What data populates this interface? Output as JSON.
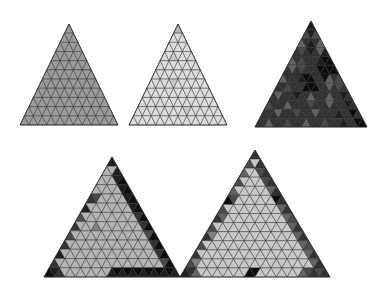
{
  "figure": {
    "background_color": "#ffffff",
    "width": 387,
    "height": 289,
    "edge_color": "#2b2b2b",
    "edge_width": 0.45,
    "palette": {
      "black": "#0d0d0d",
      "very_dark": "#1f1f1f",
      "dark": "#333333",
      "dark_mid": "#4a4a4a",
      "mid_dark": "#636363",
      "mid": "#808080",
      "mid_light": "#9a9a9a",
      "light": "#b4b4b4",
      "lighter": "#c8c8c8",
      "very_light": "#dcdcdc",
      "near_white": "#ededed"
    },
    "panels": [
      {
        "name": "panel-top-left",
        "index": 0,
        "apex_x": 69,
        "apex_y": 24,
        "half_base": 49,
        "base_y": 125,
        "rows": 11,
        "base_fill": "#9a9a9a",
        "description": "uniform medium gray triangular mesh",
        "overrides": []
      },
      {
        "name": "panel-top-middle",
        "index": 1,
        "apex_x": 178,
        "apex_y": 24,
        "half_base": 49,
        "base_y": 125,
        "rows": 11,
        "base_fill": "#dcdcdc",
        "description": "uniform light gray triangular mesh",
        "overrides": [
          {
            "row": 0,
            "cell": 0,
            "fill": "#b4b4b4"
          },
          {
            "row": 3,
            "cell": 2,
            "fill": "#c8c8c8"
          },
          {
            "row": 6,
            "cell": 5,
            "fill": "#c8c8c8"
          },
          {
            "row": 9,
            "cell": 11,
            "fill": "#c8c8c8"
          }
        ]
      },
      {
        "name": "panel-top-right",
        "index": 2,
        "apex_x": 311,
        "apex_y": 21,
        "half_base": 56,
        "base_y": 127,
        "rows": 12,
        "base_fill": "#333333",
        "description": "dark mesh with mottled light and black cells",
        "overrides": [
          {
            "row": 0,
            "cell": 0,
            "fill": "#1f1f1f"
          },
          {
            "row": 1,
            "cell": 0,
            "fill": "#4a4a4a"
          },
          {
            "row": 1,
            "cell": 1,
            "fill": "#1f1f1f"
          },
          {
            "row": 1,
            "cell": 2,
            "fill": "#4a4a4a"
          },
          {
            "row": 2,
            "cell": 0,
            "fill": "#636363"
          },
          {
            "row": 2,
            "cell": 2,
            "fill": "#1f1f1f"
          },
          {
            "row": 2,
            "cell": 4,
            "fill": "#636363"
          },
          {
            "row": 3,
            "cell": 1,
            "fill": "#4a4a4a"
          },
          {
            "row": 3,
            "cell": 3,
            "fill": "#1f1f1f"
          },
          {
            "row": 3,
            "cell": 5,
            "fill": "#636363"
          },
          {
            "row": 3,
            "cell": 6,
            "fill": "#1f1f1f"
          },
          {
            "row": 4,
            "cell": 0,
            "fill": "#636363"
          },
          {
            "row": 4,
            "cell": 2,
            "fill": "#4a4a4a"
          },
          {
            "row": 4,
            "cell": 6,
            "fill": "#1f1f1f"
          },
          {
            "row": 4,
            "cell": 7,
            "fill": "#0d0d0d"
          },
          {
            "row": 4,
            "cell": 8,
            "fill": "#0d0d0d"
          },
          {
            "row": 5,
            "cell": 1,
            "fill": "#636363"
          },
          {
            "row": 5,
            "cell": 3,
            "fill": "#4a4a4a"
          },
          {
            "row": 5,
            "cell": 7,
            "fill": "#0d0d0d"
          },
          {
            "row": 5,
            "cell": 8,
            "fill": "#0d0d0d"
          },
          {
            "row": 5,
            "cell": 9,
            "fill": "#0d0d0d"
          },
          {
            "row": 5,
            "cell": 10,
            "fill": "#0d0d0d"
          },
          {
            "row": 6,
            "cell": 0,
            "fill": "#636363"
          },
          {
            "row": 6,
            "cell": 4,
            "fill": "#1f1f1f"
          },
          {
            "row": 6,
            "cell": 5,
            "fill": "#0d0d0d"
          },
          {
            "row": 6,
            "cell": 6,
            "fill": "#0d0d0d"
          },
          {
            "row": 6,
            "cell": 9,
            "fill": "#0d0d0d"
          },
          {
            "row": 6,
            "cell": 10,
            "fill": "#636363"
          },
          {
            "row": 6,
            "cell": 12,
            "fill": "#4a4a4a"
          },
          {
            "row": 7,
            "cell": 2,
            "fill": "#4a4a4a"
          },
          {
            "row": 7,
            "cell": 6,
            "fill": "#0d0d0d"
          },
          {
            "row": 7,
            "cell": 7,
            "fill": "#0d0d0d"
          },
          {
            "row": 7,
            "cell": 8,
            "fill": "#0d0d0d"
          },
          {
            "row": 7,
            "cell": 11,
            "fill": "#636363"
          },
          {
            "row": 7,
            "cell": 13,
            "fill": "#4a4a4a"
          },
          {
            "row": 8,
            "cell": 1,
            "fill": "#636363"
          },
          {
            "row": 8,
            "cell": 5,
            "fill": "#1f1f1f"
          },
          {
            "row": 8,
            "cell": 8,
            "fill": "#636363"
          },
          {
            "row": 8,
            "cell": 12,
            "fill": "#636363"
          },
          {
            "row": 8,
            "cell": 15,
            "fill": "#1f1f1f"
          },
          {
            "row": 9,
            "cell": 0,
            "fill": "#4a4a4a"
          },
          {
            "row": 9,
            "cell": 4,
            "fill": "#636363"
          },
          {
            "row": 9,
            "cell": 9,
            "fill": "#4a4a4a"
          },
          {
            "row": 9,
            "cell": 13,
            "fill": "#636363"
          },
          {
            "row": 9,
            "cell": 17,
            "fill": "#1f1f1f"
          },
          {
            "row": 10,
            "cell": 3,
            "fill": "#636363"
          },
          {
            "row": 10,
            "cell": 7,
            "fill": "#4a4a4a"
          },
          {
            "row": 10,
            "cell": 11,
            "fill": "#636363"
          },
          {
            "row": 10,
            "cell": 16,
            "fill": "#1f1f1f"
          },
          {
            "row": 10,
            "cell": 19,
            "fill": "#0d0d0d"
          },
          {
            "row": 11,
            "cell": 2,
            "fill": "#636363"
          },
          {
            "row": 11,
            "cell": 6,
            "fill": "#4a4a4a"
          },
          {
            "row": 11,
            "cell": 10,
            "fill": "#636363"
          },
          {
            "row": 11,
            "cell": 14,
            "fill": "#4a4a4a"
          },
          {
            "row": 11,
            "cell": 18,
            "fill": "#1f1f1f"
          },
          {
            "row": 11,
            "cell": 21,
            "fill": "#0d0d0d"
          },
          {
            "row": 11,
            "cell": 22,
            "fill": "#0d0d0d"
          }
        ]
      },
      {
        "name": "panel-bottom-left",
        "index": 3,
        "apex_x": 112,
        "apex_y": 157,
        "half_base": 68,
        "base_y": 277,
        "rows": 13,
        "base_fill": "#b4b4b4",
        "description": "light gray mesh with dark right flank, dark left notch and dark base row",
        "overrides": [
          {
            "row": 0,
            "cell": 0,
            "fill": "#1f1f1f"
          },
          {
            "row": 1,
            "cell": 2,
            "fill": "#1f1f1f"
          },
          {
            "row": 2,
            "cell": 3,
            "fill": "#1f1f1f"
          },
          {
            "row": 2,
            "cell": 4,
            "fill": "#0d0d0d"
          },
          {
            "row": 3,
            "cell": 5,
            "fill": "#1f1f1f"
          },
          {
            "row": 3,
            "cell": 6,
            "fill": "#0d0d0d"
          },
          {
            "row": 4,
            "cell": 0,
            "fill": "#333333"
          },
          {
            "row": 4,
            "cell": 1,
            "fill": "#4a4a4a"
          },
          {
            "row": 4,
            "cell": 7,
            "fill": "#1f1f1f"
          },
          {
            "row": 4,
            "cell": 8,
            "fill": "#0d0d0d"
          },
          {
            "row": 5,
            "cell": 0,
            "fill": "#1f1f1f"
          },
          {
            "row": 5,
            "cell": 9,
            "fill": "#1f1f1f"
          },
          {
            "row": 5,
            "cell": 10,
            "fill": "#0d0d0d"
          },
          {
            "row": 6,
            "cell": 0,
            "fill": "#4a4a4a"
          },
          {
            "row": 6,
            "cell": 11,
            "fill": "#333333"
          },
          {
            "row": 6,
            "cell": 12,
            "fill": "#0d0d0d"
          },
          {
            "row": 7,
            "cell": 0,
            "fill": "#333333"
          },
          {
            "row": 7,
            "cell": 4,
            "fill": "#808080"
          },
          {
            "row": 7,
            "cell": 13,
            "fill": "#333333"
          },
          {
            "row": 7,
            "cell": 14,
            "fill": "#0d0d0d"
          },
          {
            "row": 8,
            "cell": 0,
            "fill": "#4a4a4a"
          },
          {
            "row": 8,
            "cell": 15,
            "fill": "#4a4a4a"
          },
          {
            "row": 8,
            "cell": 16,
            "fill": "#0d0d0d"
          },
          {
            "row": 9,
            "cell": 0,
            "fill": "#333333"
          },
          {
            "row": 9,
            "cell": 17,
            "fill": "#333333"
          },
          {
            "row": 9,
            "cell": 18,
            "fill": "#0d0d0d"
          },
          {
            "row": 10,
            "cell": 0,
            "fill": "#1f1f1f"
          },
          {
            "row": 10,
            "cell": 19,
            "fill": "#333333"
          },
          {
            "row": 10,
            "cell": 20,
            "fill": "#0d0d0d"
          },
          {
            "row": 11,
            "cell": 0,
            "fill": "#333333"
          },
          {
            "row": 11,
            "cell": 21,
            "fill": "#4a4a4a"
          },
          {
            "row": 11,
            "cell": 22,
            "fill": "#0d0d0d"
          },
          {
            "row": 12,
            "cell": 0,
            "fill": "#0d0d0d"
          },
          {
            "row": 12,
            "cell": 1,
            "fill": "#1f1f1f"
          },
          {
            "row": 12,
            "cell": 2,
            "fill": "#333333"
          },
          {
            "row": 12,
            "cell": 12,
            "fill": "#1f1f1f"
          },
          {
            "row": 12,
            "cell": 13,
            "fill": "#0d0d0d"
          },
          {
            "row": 12,
            "cell": 14,
            "fill": "#1f1f1f"
          },
          {
            "row": 12,
            "cell": 15,
            "fill": "#0d0d0d"
          },
          {
            "row": 12,
            "cell": 16,
            "fill": "#1f1f1f"
          },
          {
            "row": 12,
            "cell": 17,
            "fill": "#0d0d0d"
          },
          {
            "row": 12,
            "cell": 18,
            "fill": "#1f1f1f"
          },
          {
            "row": 12,
            "cell": 19,
            "fill": "#0d0d0d"
          },
          {
            "row": 12,
            "cell": 20,
            "fill": "#1f1f1f"
          },
          {
            "row": 12,
            "cell": 21,
            "fill": "#0d0d0d"
          },
          {
            "row": 12,
            "cell": 22,
            "fill": "#1f1f1f"
          },
          {
            "row": 12,
            "cell": 23,
            "fill": "#0d0d0d"
          },
          {
            "row": 12,
            "cell": 24,
            "fill": "#1f1f1f"
          }
        ]
      },
      {
        "name": "panel-bottom-right",
        "index": 4,
        "apex_x": 255,
        "apex_y": 150,
        "half_base": 75,
        "base_y": 277,
        "rows": 14,
        "base_fill": "#c8c8c8",
        "description": "light gray mesh with dark gray flanks on both edges and isolated black cells",
        "overrides": [
          {
            "row": 0,
            "cell": 0,
            "fill": "#333333"
          },
          {
            "row": 1,
            "cell": 0,
            "fill": "#4a4a4a"
          },
          {
            "row": 1,
            "cell": 2,
            "fill": "#333333"
          },
          {
            "row": 2,
            "cell": 0,
            "fill": "#636363"
          },
          {
            "row": 2,
            "cell": 3,
            "fill": "#4a4a4a"
          },
          {
            "row": 2,
            "cell": 4,
            "fill": "#333333"
          },
          {
            "row": 3,
            "cell": 0,
            "fill": "#4a4a4a"
          },
          {
            "row": 3,
            "cell": 5,
            "fill": "#4a4a4a"
          },
          {
            "row": 3,
            "cell": 6,
            "fill": "#333333"
          },
          {
            "row": 4,
            "cell": 0,
            "fill": "#636363"
          },
          {
            "row": 4,
            "cell": 7,
            "fill": "#636363"
          },
          {
            "row": 4,
            "cell": 8,
            "fill": "#333333"
          },
          {
            "row": 5,
            "cell": 0,
            "fill": "#0d0d0d"
          },
          {
            "row": 5,
            "cell": 1,
            "fill": "#4a4a4a"
          },
          {
            "row": 5,
            "cell": 9,
            "fill": "#0d0d0d"
          },
          {
            "row": 5,
            "cell": 10,
            "fill": "#333333"
          },
          {
            "row": 6,
            "cell": 0,
            "fill": "#4a4a4a"
          },
          {
            "row": 6,
            "cell": 11,
            "fill": "#636363"
          },
          {
            "row": 6,
            "cell": 12,
            "fill": "#333333"
          },
          {
            "row": 7,
            "cell": 0,
            "fill": "#333333"
          },
          {
            "row": 7,
            "cell": 1,
            "fill": "#636363"
          },
          {
            "row": 7,
            "cell": 13,
            "fill": "#636363"
          },
          {
            "row": 7,
            "cell": 14,
            "fill": "#4a4a4a"
          },
          {
            "row": 8,
            "cell": 0,
            "fill": "#4a4a4a"
          },
          {
            "row": 8,
            "cell": 15,
            "fill": "#636363"
          },
          {
            "row": 8,
            "cell": 16,
            "fill": "#333333"
          },
          {
            "row": 9,
            "cell": 0,
            "fill": "#333333"
          },
          {
            "row": 9,
            "cell": 1,
            "fill": "#808080"
          },
          {
            "row": 9,
            "cell": 17,
            "fill": "#636363"
          },
          {
            "row": 9,
            "cell": 18,
            "fill": "#333333"
          },
          {
            "row": 10,
            "cell": 0,
            "fill": "#4a4a4a"
          },
          {
            "row": 10,
            "cell": 19,
            "fill": "#636363"
          },
          {
            "row": 10,
            "cell": 20,
            "fill": "#4a4a4a"
          },
          {
            "row": 11,
            "cell": 0,
            "fill": "#333333"
          },
          {
            "row": 11,
            "cell": 21,
            "fill": "#636363"
          },
          {
            "row": 11,
            "cell": 22,
            "fill": "#333333"
          },
          {
            "row": 12,
            "cell": 0,
            "fill": "#4a4a4a"
          },
          {
            "row": 12,
            "cell": 1,
            "fill": "#808080"
          },
          {
            "row": 12,
            "cell": 23,
            "fill": "#636363"
          },
          {
            "row": 12,
            "cell": 24,
            "fill": "#333333"
          },
          {
            "row": 13,
            "cell": 0,
            "fill": "#1f1f1f"
          },
          {
            "row": 13,
            "cell": 1,
            "fill": "#333333"
          },
          {
            "row": 13,
            "cell": 2,
            "fill": "#636363"
          },
          {
            "row": 13,
            "cell": 12,
            "fill": "#0d0d0d"
          },
          {
            "row": 13,
            "cell": 13,
            "fill": "#0d0d0d"
          },
          {
            "row": 13,
            "cell": 22,
            "fill": "#636363"
          },
          {
            "row": 13,
            "cell": 23,
            "fill": "#4a4a4a"
          },
          {
            "row": 13,
            "cell": 24,
            "fill": "#333333"
          },
          {
            "row": 13,
            "cell": 25,
            "fill": "#4a4a4a"
          },
          {
            "row": 13,
            "cell": 26,
            "fill": "#333333"
          }
        ]
      }
    ]
  }
}
